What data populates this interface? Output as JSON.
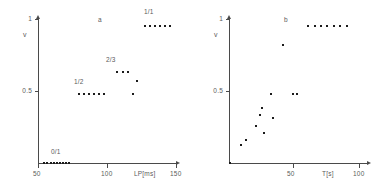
{
  "figure": {
    "panels": [
      {
        "id": "a",
        "label": "a",
        "y_axis": {
          "name": "v",
          "ticks": [
            {
              "value": 0.5,
              "label": "0.5"
            },
            {
              "value": 1.0,
              "label": "1"
            }
          ],
          "range": [
            0,
            1.05
          ]
        },
        "x_axis": {
          "title": "LP[ms]",
          "ticks": [
            {
              "value": 50,
              "label": "50"
            },
            {
              "value": 100,
              "label": "100"
            },
            {
              "value": 150,
              "label": "150"
            }
          ],
          "range": [
            45,
            155
          ]
        },
        "annotations": [
          {
            "text": "0/1",
            "x": 62,
            "y": 0.07
          },
          {
            "text": "1/2",
            "x": 88,
            "y": 0.6
          },
          {
            "text": "2/3",
            "x": 113,
            "y": 0.76
          },
          {
            "text": "1/1",
            "x": 139,
            "y": 1.06
          }
        ]
      },
      {
        "id": "b",
        "label": "b",
        "y_axis": {
          "name": "v",
          "ticks": [
            {
              "value": 0.5,
              "label": "0.5"
            },
            {
              "value": 1.0,
              "label": "1"
            }
          ],
          "range": [
            0,
            1.05
          ]
        },
        "x_axis": {
          "title": "T[s]",
          "ticks": [
            {
              "value": 50,
              "label": "50"
            },
            {
              "value": 100,
              "label": "100"
            }
          ],
          "range": [
            0,
            108
          ]
        },
        "annotations": [
          {
            "text": "b",
            "x": 42,
            "y": 1.0
          }
        ]
      }
    ]
  },
  "chart_data": [
    {
      "type": "scatter",
      "title": "",
      "panel": "a",
      "xlabel": "LP[ms]",
      "ylabel": "v",
      "xlim": [
        45,
        155
      ],
      "ylim": [
        0,
        1.05
      ],
      "grid": false,
      "legend": null,
      "xticks": [
        50,
        100,
        150
      ],
      "yticks": [
        0.5,
        1
      ],
      "annotations": [
        "0/1",
        "1/2",
        "2/3",
        "1/1"
      ],
      "points": [
        {
          "x": 50.0,
          "y": 0.0
        },
        {
          "x": 52.5,
          "y": 0.0
        },
        {
          "x": 55.0,
          "y": 0.0
        },
        {
          "x": 57.5,
          "y": 0.0
        },
        {
          "x": 60.0,
          "y": 0.0
        },
        {
          "x": 62.5,
          "y": 0.0
        },
        {
          "x": 65.0,
          "y": 0.0
        },
        {
          "x": 67.5,
          "y": 0.0
        },
        {
          "x": 70.0,
          "y": 0.0
        },
        {
          "x": 78.0,
          "y": 0.5
        },
        {
          "x": 82.0,
          "y": 0.5
        },
        {
          "x": 86.0,
          "y": 0.5
        },
        {
          "x": 90.0,
          "y": 0.5
        },
        {
          "x": 94.0,
          "y": 0.5
        },
        {
          "x": 98.0,
          "y": 0.5
        },
        {
          "x": 108.0,
          "y": 0.667
        },
        {
          "x": 112.5,
          "y": 0.667
        },
        {
          "x": 117.0,
          "y": 0.667
        },
        {
          "x": 121.0,
          "y": 0.5
        },
        {
          "x": 124.0,
          "y": 0.6
        },
        {
          "x": 130.0,
          "y": 1.0
        },
        {
          "x": 134.0,
          "y": 1.0
        },
        {
          "x": 138.0,
          "y": 1.0
        },
        {
          "x": 142.0,
          "y": 1.0
        },
        {
          "x": 146.0,
          "y": 1.0
        },
        {
          "x": 150.0,
          "y": 1.0
        }
      ]
    },
    {
      "type": "scatter",
      "title": "",
      "panel": "b",
      "xlabel": "T[s]",
      "ylabel": "v",
      "xlim": [
        0,
        108
      ],
      "ylim": [
        0,
        1.05
      ],
      "grid": false,
      "legend": null,
      "xticks": [
        50,
        100
      ],
      "yticks": [
        0.5,
        1
      ],
      "annotations": [
        "b"
      ],
      "points": [
        {
          "x": 0.5,
          "y": 0.0
        },
        {
          "x": 9.0,
          "y": 0.13
        },
        {
          "x": 13.0,
          "y": 0.17
        },
        {
          "x": 21.0,
          "y": 0.27
        },
        {
          "x": 24.5,
          "y": 0.35
        },
        {
          "x": 25.5,
          "y": 0.4
        },
        {
          "x": 27.5,
          "y": 0.22
        },
        {
          "x": 33.0,
          "y": 0.5
        },
        {
          "x": 34.5,
          "y": 0.33
        },
        {
          "x": 42.0,
          "y": 0.86
        },
        {
          "x": 50.0,
          "y": 0.5
        },
        {
          "x": 53.0,
          "y": 0.5
        },
        {
          "x": 62.0,
          "y": 1.0
        },
        {
          "x": 67.0,
          "y": 1.0
        },
        {
          "x": 72.0,
          "y": 1.0
        },
        {
          "x": 77.0,
          "y": 1.0
        },
        {
          "x": 82.0,
          "y": 1.0
        },
        {
          "x": 87.0,
          "y": 1.0
        },
        {
          "x": 92.0,
          "y": 1.0
        }
      ]
    }
  ]
}
